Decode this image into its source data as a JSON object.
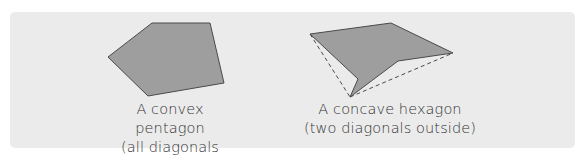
{
  "figures": [
    {
      "name": "convex-pentagon",
      "caption_line1": "A convex pentagon",
      "caption_line2": "(all diagonals inside)",
      "points": "108,57 152,23 210,23 224,83 148,96",
      "fill": "#9e9e9e",
      "stroke": "#4a4a4a"
    },
    {
      "name": "concave-hexagon",
      "caption_line1": "A concave hexagon",
      "caption_line2": "(two diagonals outside)",
      "points": "310,34 391,23 453,53 398,61 350,97 358,79",
      "fill": "#9e9e9e",
      "stroke": "#4a4a4a",
      "dashed_diagonals": [
        {
          "x1": 310,
          "y1": 34,
          "x2": 350,
          "y2": 97
        },
        {
          "x1": 350,
          "y1": 97,
          "x2": 453,
          "y2": 53
        }
      ]
    }
  ],
  "colors": {
    "panel": "#ebebeb",
    "shape_fill": "#9e9e9e",
    "stroke": "#4a4a4a",
    "text": "#333333"
  }
}
